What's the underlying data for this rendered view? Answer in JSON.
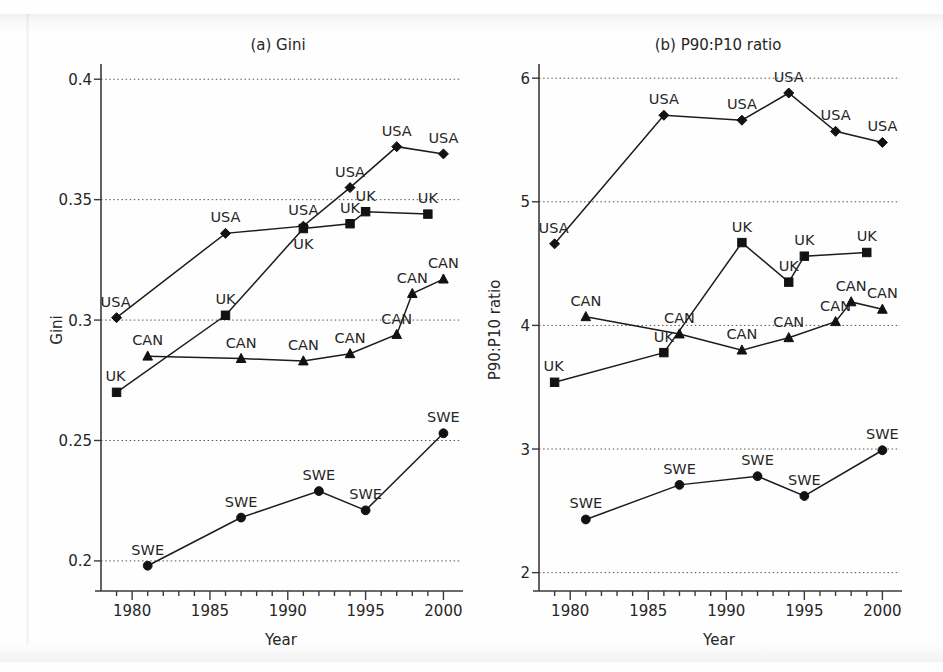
{
  "figure": {
    "panels": [
      {
        "key": "gini",
        "title": "(a) Gini",
        "xlabel": "Year",
        "ylabel": "Gini"
      },
      {
        "key": "p90p10",
        "title": "(b) P90:P10 ratio",
        "xlabel": "Year",
        "ylabel": "P90:P10 ratio"
      }
    ]
  },
  "chart_data": [
    {
      "type": "line",
      "id": "panel-a-gini",
      "title": "(a) Gini",
      "xlabel": "Year",
      "ylabel": "Gini",
      "xlim": [
        1978,
        2001
      ],
      "ylim": [
        0.19,
        0.403
      ],
      "xticks": [
        1980,
        1985,
        1990,
        1995,
        2000
      ],
      "xtick_labels": [
        "1980",
        "1985",
        "1990",
        "1995",
        "2000"
      ],
      "yticks": [
        0.2,
        0.25,
        0.3,
        0.35,
        0.4
      ],
      "ytick_labels": [
        "0.2",
        "0.25",
        "0.3",
        "0.35",
        "0.4"
      ],
      "grid": "horizontal-dotted",
      "legend": "point-labels",
      "series": [
        {
          "name": "USA",
          "marker": "diamond",
          "x": [
            1979,
            1986,
            1991,
            1994,
            1997,
            2000
          ],
          "y": [
            0.301,
            0.336,
            0.339,
            0.355,
            0.372,
            0.369
          ],
          "labels": [
            "USA",
            "USA",
            "USA",
            "USA",
            "USA",
            "USA"
          ],
          "label_pos": [
            "left",
            "above",
            "above",
            "above",
            "above",
            "above"
          ]
        },
        {
          "name": "UK",
          "marker": "square",
          "x": [
            1979,
            1986,
            1991,
            1994,
            1995,
            1999
          ],
          "y": [
            0.27,
            0.302,
            0.338,
            0.34,
            0.345,
            0.344
          ],
          "labels": [
            "UK",
            "UK",
            "UK",
            "UK",
            "UK",
            "UK"
          ],
          "label_pos": [
            "left",
            "above",
            "below",
            "above",
            "above",
            "above"
          ]
        },
        {
          "name": "CAN",
          "marker": "triangle",
          "x": [
            1981,
            1987,
            1991,
            1994,
            1997,
            1998,
            2000
          ],
          "y": [
            0.285,
            0.284,
            0.283,
            0.286,
            0.294,
            0.311,
            0.317
          ],
          "labels": [
            "CAN",
            "CAN",
            "CAN",
            "CAN",
            "CAN",
            "CAN",
            "CAN"
          ],
          "label_pos": [
            "above",
            "above",
            "above",
            "above",
            "above",
            "above",
            "above"
          ]
        },
        {
          "name": "SWE",
          "marker": "circle",
          "x": [
            1981,
            1987,
            1992,
            1995,
            2000
          ],
          "y": [
            0.198,
            0.218,
            0.229,
            0.221,
            0.253
          ],
          "labels": [
            "SWE",
            "SWE",
            "SWE",
            "SWE",
            "SWE"
          ],
          "label_pos": [
            "above",
            "above",
            "above",
            "above",
            "above"
          ]
        }
      ]
    },
    {
      "type": "line",
      "id": "panel-b-p90p10",
      "title": "(b) P90:P10 ratio",
      "xlabel": "Year",
      "ylabel": "P90:P10 ratio",
      "xlim": [
        1978,
        2001
      ],
      "ylim": [
        1.9,
        6.05
      ],
      "xticks": [
        1980,
        1985,
        1990,
        1995,
        2000
      ],
      "xtick_labels": [
        "1980",
        "1985",
        "1990",
        "1995",
        "2000"
      ],
      "yticks": [
        2,
        3,
        4,
        5,
        6
      ],
      "ytick_labels": [
        "2",
        "3",
        "4",
        "5",
        "6"
      ],
      "grid": "horizontal-dotted",
      "legend": "point-labels",
      "series": [
        {
          "name": "USA",
          "marker": "diamond",
          "x": [
            1979,
            1986,
            1991,
            1994,
            1997,
            2000
          ],
          "y": [
            4.66,
            5.7,
            5.66,
            5.88,
            5.57,
            5.48
          ],
          "labels": [
            "USA",
            "USA",
            "USA",
            "USA",
            "USA",
            "USA"
          ],
          "label_pos": [
            "left",
            "above",
            "above",
            "above",
            "above",
            "above"
          ]
        },
        {
          "name": "UK",
          "marker": "square",
          "x": [
            1979,
            1986,
            1991,
            1994,
            1995,
            1999
          ],
          "y": [
            3.54,
            3.78,
            4.67,
            4.35,
            4.56,
            4.59
          ],
          "labels": [
            "UK",
            "UK",
            "UK",
            "UK",
            "UK",
            "UK"
          ],
          "label_pos": [
            "left",
            "above",
            "above",
            "above",
            "above",
            "above"
          ]
        },
        {
          "name": "CAN",
          "marker": "triangle",
          "x": [
            1981,
            1987,
            1991,
            1994,
            1997,
            1998,
            2000
          ],
          "y": [
            4.07,
            3.93,
            3.8,
            3.9,
            4.03,
            4.19,
            4.13
          ],
          "labels": [
            "CAN",
            "CAN",
            "CAN",
            "CAN",
            "CAN",
            "CAN",
            "CAN"
          ],
          "label_pos": [
            "above",
            "above",
            "above",
            "above",
            "above",
            "above",
            "above"
          ]
        },
        {
          "name": "SWE",
          "marker": "circle",
          "x": [
            1981,
            1987,
            1992,
            1995,
            2000
          ],
          "y": [
            2.43,
            2.71,
            2.78,
            2.62,
            2.99
          ],
          "labels": [
            "SWE",
            "SWE",
            "SWE",
            "SWE",
            "SWE"
          ],
          "label_pos": [
            "above",
            "above",
            "above",
            "above",
            "above"
          ]
        }
      ]
    }
  ]
}
